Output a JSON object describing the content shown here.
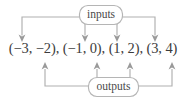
{
  "diagram": {
    "type": "mapping-diagram",
    "title": "",
    "nodes": [
      {
        "id": "inputs",
        "label": "inputs",
        "shape": "rounded-rect",
        "position": "top"
      },
      {
        "id": "outputs",
        "label": "outputs",
        "shape": "rounded-rect",
        "position": "bottom"
      }
    ],
    "pairs_line": "(−3, −2), (−1, 0), (1, 2), (3, 4)",
    "ordered_pairs": [
      {
        "input": "−3",
        "output": "−2"
      },
      {
        "input": "−1",
        "output": "0"
      },
      {
        "input": "1",
        "output": "2"
      },
      {
        "input": "3",
        "output": "4"
      }
    ],
    "input_arrow_count": 4,
    "output_arrow_count": 4,
    "arrow_direction_inputs": "down",
    "arrow_direction_outputs": "up",
    "colors": {
      "line": "#b0b0b0",
      "arrow": "#9a9a9a",
      "box_border": "#b5b5b5",
      "box_fill": "#ffffff",
      "node_text": "#4a4a4a",
      "pairs_text": "#3c3c3c",
      "background": "#ffffff"
    }
  }
}
